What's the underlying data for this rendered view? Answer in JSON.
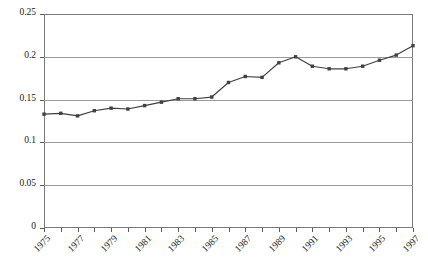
{
  "chart_data": {
    "type": "line",
    "title": "",
    "subtitle": "",
    "xlabel": "",
    "ylabel": "",
    "x": [
      1975,
      1976,
      1977,
      1978,
      1979,
      1980,
      1981,
      1982,
      1983,
      1984,
      1985,
      1986,
      1987,
      1988,
      1989,
      1990,
      1991,
      1992,
      1993,
      1994,
      1995,
      1996,
      1997
    ],
    "values": [
      0.133,
      0.134,
      0.131,
      0.137,
      0.14,
      0.139,
      0.143,
      0.147,
      0.151,
      0.151,
      0.153,
      0.17,
      0.177,
      0.176,
      0.193,
      0.2,
      0.189,
      0.186,
      0.186,
      0.189,
      0.196,
      0.202,
      0.213
    ],
    "series": [
      {
        "name": "series-1",
        "values": [
          0.133,
          0.134,
          0.131,
          0.137,
          0.14,
          0.139,
          0.143,
          0.147,
          0.151,
          0.151,
          0.153,
          0.17,
          0.177,
          0.176,
          0.193,
          0.2,
          0.189,
          0.186,
          0.186,
          0.189,
          0.196,
          0.202,
          0.213
        ]
      }
    ],
    "ylim": [
      0,
      0.25
    ],
    "ytick_values": [
      0,
      0.05,
      0.1,
      0.15,
      0.2,
      0.25
    ],
    "ytick_labels": [
      "0",
      "0.05",
      "0.1",
      "0.15",
      "0.2",
      "0.25"
    ],
    "xtick_labels": [
      "1975",
      "1977",
      "1979",
      "1981",
      "1983",
      "1985",
      "1987",
      "1989",
      "1991",
      "1993",
      "1995",
      "1997"
    ],
    "xtick_values": [
      1975,
      1977,
      1979,
      1981,
      1983,
      1985,
      1987,
      1989,
      1991,
      1993,
      1995,
      1997
    ],
    "grid": true,
    "grid_axis": "y",
    "legend": false,
    "legend_position": "none",
    "line_color": "#404040",
    "marker_color": "#404040",
    "marker_shape": "square",
    "plot_background": "#ffffff",
    "border_color": "#7a7a7a",
    "gridline_color": "#9a9a9a"
  }
}
